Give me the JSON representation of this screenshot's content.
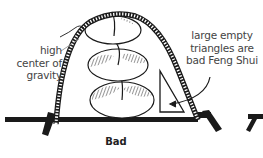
{
  "figure": {
    "caption": "Bad",
    "annotations": {
      "left": {
        "lines": [
          "high",
          "center of",
          "gravity"
        ],
        "target": "top dumpling stack"
      },
      "right": {
        "lines": [
          "large empty",
          "triangles are",
          "bad Feng Shui"
        ],
        "target": "empty triangle"
      }
    },
    "elements": {
      "arch": "ladder-arch",
      "stack": [
        "dumpling-top",
        "dumpling-middle",
        "dumpling-bottom"
      ],
      "triangle": "empty-triangle",
      "ground": "ground-bar"
    },
    "colors": {
      "ink": "#1a1a1a",
      "text": "#444444",
      "background": "#ffffff"
    }
  }
}
